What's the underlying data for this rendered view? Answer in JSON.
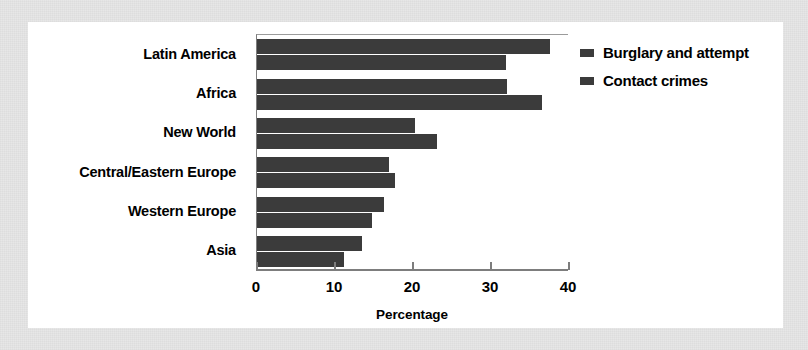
{
  "chart_data": {
    "type": "bar",
    "orientation": "horizontal",
    "title": "",
    "xlabel": "Percentage",
    "ylabel": "",
    "xlim": [
      0,
      40
    ],
    "xticks": [
      0,
      10,
      20,
      30,
      40
    ],
    "xtick_labels": [
      "0",
      "10",
      "20",
      "30",
      "40"
    ],
    "grid": false,
    "legend_position": "right",
    "categories": [
      "Latin America",
      "Africa",
      "New World",
      "Central/Eastern Europe",
      "Western Europe",
      "Asia"
    ],
    "series": [
      {
        "name": "Burglary and attempt",
        "color": "#3b3b3b",
        "values": [
          37.5,
          32.0,
          20.2,
          16.9,
          16.3,
          13.5
        ]
      },
      {
        "name": "Contact crimes",
        "color": "#3b3b3b",
        "values": [
          31.9,
          36.6,
          23.1,
          17.7,
          14.7,
          11.1
        ]
      }
    ]
  },
  "legend": {
    "entries": [
      {
        "label": "Burglary and attempt"
      },
      {
        "label": "Contact crimes"
      }
    ]
  },
  "axis": {
    "x_title": "Percentage"
  }
}
